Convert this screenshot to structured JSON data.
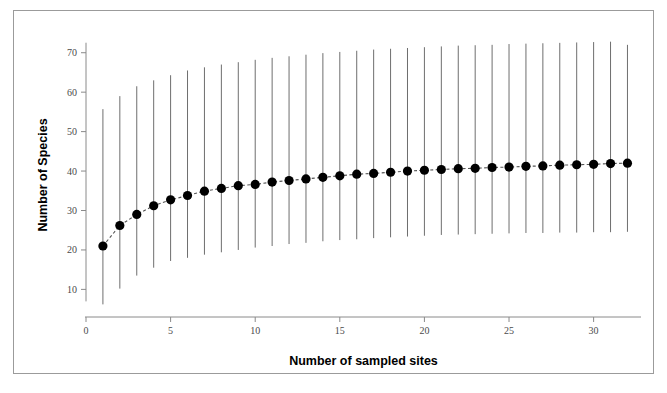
{
  "caption": {
    "clipped_text": ""
  },
  "chart_data": {
    "type": "scatter",
    "title": "",
    "xlabel": "Number of sampled sites",
    "ylabel": "Number of Species",
    "xlim": [
      0,
      32.8
    ],
    "ylim": [
      3,
      75
    ],
    "xticks": [
      0,
      5,
      10,
      15,
      20,
      25,
      30
    ],
    "xtick_labels": [
      "0",
      "5",
      "10",
      "15",
      "20",
      "25",
      "30"
    ],
    "yticks": [
      10,
      20,
      30,
      40,
      50,
      60,
      70
    ],
    "ytick_labels": [
      "10",
      "20",
      "30",
      "40",
      "50",
      "60",
      "70"
    ],
    "grid": false,
    "legend": null,
    "marker": "filled-circle",
    "marker_color": "#000000",
    "line_style": "dashed",
    "line_color": "#555555",
    "errorbar_color": "#6e6e6e",
    "errorbar_style": "vertical-line-no-caps",
    "x": [
      1,
      2,
      3,
      4,
      5,
      6,
      7,
      8,
      9,
      10,
      11,
      12,
      13,
      14,
      15,
      16,
      17,
      18,
      19,
      20,
      21,
      22,
      23,
      24,
      25,
      26,
      27,
      28,
      29,
      30,
      31,
      32
    ],
    "values": [
      21.0,
      26.2,
      29.0,
      31.2,
      32.7,
      33.8,
      34.9,
      35.6,
      36.3,
      36.6,
      37.2,
      37.6,
      38.0,
      38.4,
      38.8,
      39.2,
      39.4,
      39.7,
      40.0,
      40.2,
      40.4,
      40.6,
      40.7,
      40.9,
      41.0,
      41.2,
      41.3,
      41.5,
      41.6,
      41.7,
      41.9,
      42.0
    ],
    "err_low": [
      6.2,
      10.2,
      13.5,
      15.5,
      17.2,
      18.0,
      18.8,
      19.4,
      20.0,
      20.6,
      21.0,
      21.5,
      21.8,
      22.2,
      22.5,
      22.7,
      23.0,
      23.2,
      23.4,
      23.6,
      23.8,
      23.9,
      24.0,
      24.1,
      24.2,
      24.3,
      24.3,
      24.4,
      24.4,
      24.5,
      24.5,
      24.6
    ],
    "err_high": [
      55.7,
      59.0,
      61.5,
      63.0,
      64.3,
      65.5,
      66.3,
      67.0,
      67.6,
      68.2,
      68.7,
      69.1,
      69.5,
      69.9,
      70.2,
      70.5,
      70.8,
      71.0,
      71.2,
      71.4,
      71.6,
      71.8,
      71.9,
      72.0,
      72.2,
      72.3,
      72.4,
      72.5,
      72.6,
      72.7,
      72.8,
      72.0
    ]
  }
}
